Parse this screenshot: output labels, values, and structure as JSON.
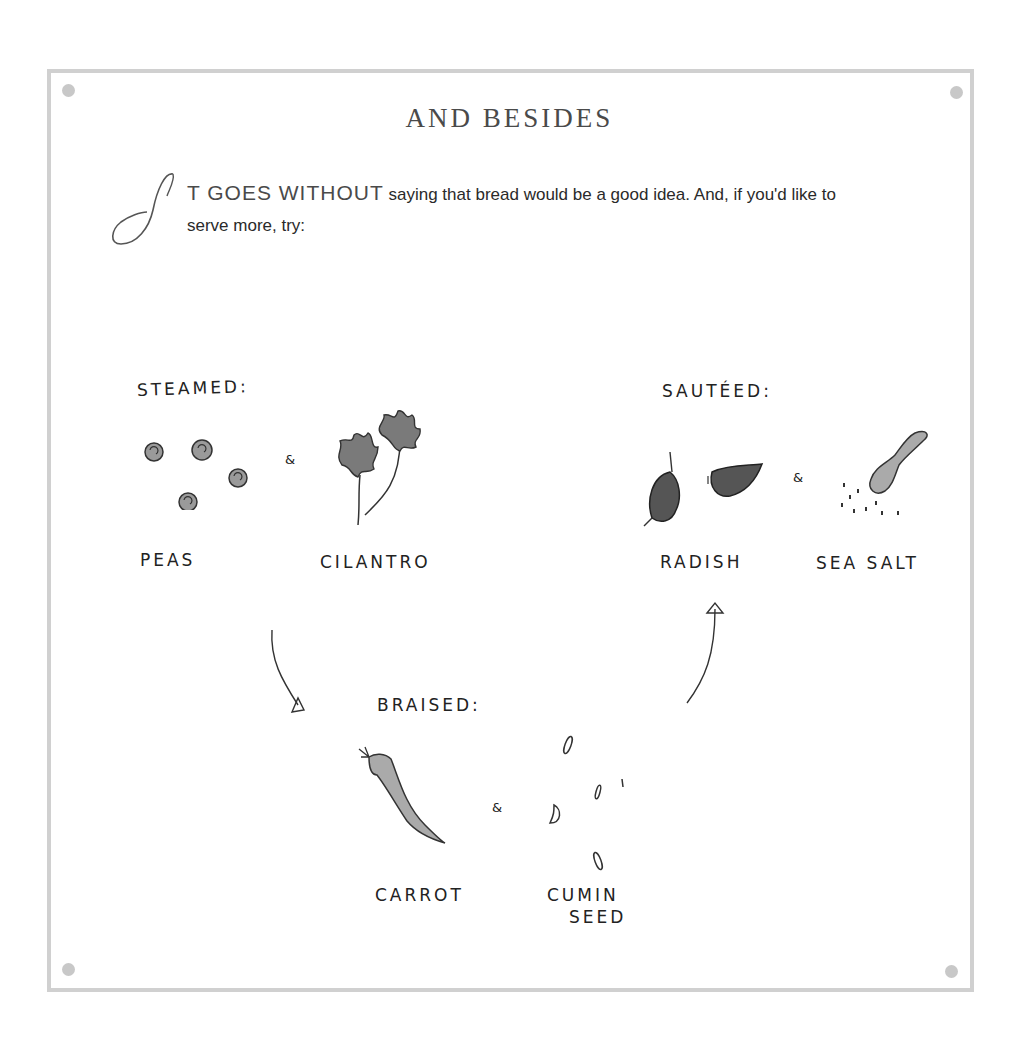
{
  "page": {
    "title": "AND BESIDES",
    "intro": {
      "drop_cap": "I",
      "lead_in": "T GOES WITHOUT",
      "text_line1": " saying that bread would be a good idea. And, if you'd like to",
      "text_line2": "serve more, try:"
    }
  },
  "diagram": {
    "groups": [
      {
        "heading": "STEAMED:",
        "items": [
          {
            "label": "PEAS",
            "icon": "peas-drawing"
          },
          {
            "label": "CILANTRO",
            "icon": "cilantro-drawing"
          }
        ]
      },
      {
        "heading": "SAUTÉED:",
        "items": [
          {
            "label": "RADISH",
            "icon": "radish-drawing"
          },
          {
            "label": "SEA SALT",
            "icon": "sea-salt-spoon-drawing"
          }
        ]
      },
      {
        "heading": "BRAISED:",
        "items": [
          {
            "label": "CARROT",
            "icon": "carrot-drawing"
          },
          {
            "label": "CUMIN SEED",
            "label_lines": [
              "CUMIN",
              "SEED"
            ],
            "icon": "cumin-seed-drawing"
          }
        ]
      }
    ],
    "separator_glyph": "&",
    "arrows": [
      "steamed-to-braised",
      "braised-to-sauteed"
    ]
  },
  "colors": {
    "frame": "#d0d0d0",
    "ink": "#222222",
    "wash": "#8a8a8a",
    "title": "#4a4a4a"
  }
}
